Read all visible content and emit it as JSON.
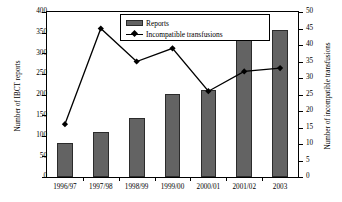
{
  "chart_data": {
    "type": "bar",
    "title": "",
    "xlabel": "",
    "categories": [
      "1996/97",
      "1997/98",
      "1998/99",
      "1999/00",
      "2000/01",
      "2001/02",
      "2003"
    ],
    "series": [
      {
        "name": "Reports",
        "type": "bar",
        "axis": "left",
        "values": [
          82,
          110,
          144,
          202,
          212,
          342,
          356
        ]
      },
      {
        "name": "Incompatible transfusions",
        "type": "line",
        "axis": "right",
        "marker": "diamond",
        "values": [
          16,
          45,
          35,
          39,
          26,
          32,
          33
        ]
      }
    ],
    "left_axis": {
      "label": "Number of IBCT reports",
      "min": 0,
      "max": 400,
      "step": 50,
      "ticks": [
        "0",
        "50",
        "100",
        "150",
        "200",
        "250",
        "300",
        "350",
        "400"
      ]
    },
    "right_axis": {
      "label": "Number of incompatible transfusions",
      "min": 0,
      "max": 50,
      "step": 5,
      "ticks": [
        "0",
        "5",
        "10",
        "15",
        "20",
        "25",
        "30",
        "35",
        "40",
        "45",
        "50"
      ]
    },
    "legend": {
      "position": "top-center",
      "entries": [
        {
          "label": "Reports",
          "marker": "bar-swatch",
          "color": "#636363"
        },
        {
          "label": "Incompatible transfusions",
          "marker": "line-diamond",
          "color": "#000000"
        }
      ]
    },
    "grid": false,
    "colors": {
      "bar_fill": "#636363",
      "bar_stroke": "#2b2b2b",
      "line": "#000000",
      "axis": "#000000",
      "background": "#ffffff"
    }
  }
}
